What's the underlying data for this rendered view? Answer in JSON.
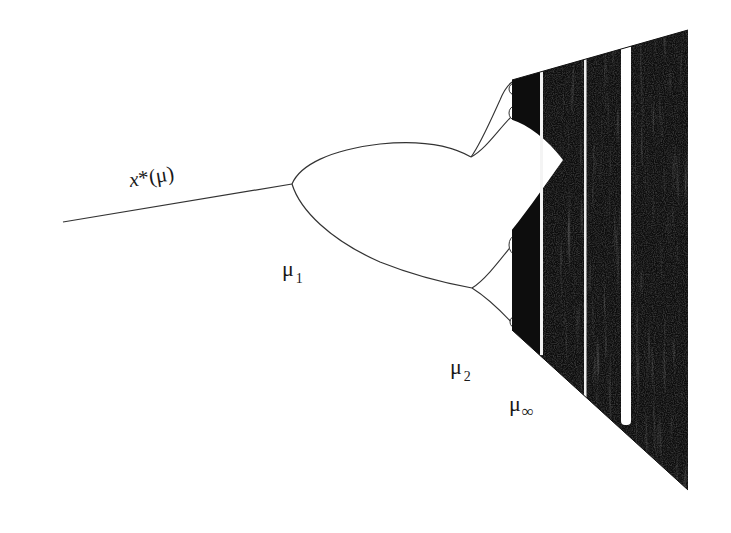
{
  "figure": {
    "background": "#ffffff",
    "ink_color": "#1a1a1a",
    "labels": {
      "fixed_point_base": "x",
      "fixed_point_suffix": "*(μ)",
      "mu1_symbol": "μ",
      "mu1_sub": "1",
      "mu2_symbol": "μ",
      "mu2_sub": "2",
      "muinf_symbol": "μ",
      "muinf_sub": "∞"
    },
    "branches": {
      "fixed_point": {
        "from": [
          63,
          222
        ],
        "to": [
          292,
          184
        ]
      },
      "period2_upper": {
        "from": [
          292,
          184
        ],
        "to": [
          471,
          157
        ]
      },
      "period2_lower": {
        "from": [
          292,
          184
        ],
        "to": [
          472,
          288
        ]
      },
      "period4": [
        {
          "from": [
            471,
            157
          ],
          "to": [
            510,
            84
          ]
        },
        {
          "from": [
            471,
            157
          ],
          "to": [
            511,
            113
          ]
        },
        {
          "from": [
            472,
            288
          ],
          "to": [
            512,
            243
          ]
        },
        {
          "from": [
            472,
            288
          ],
          "to": [
            513,
            323
          ]
        }
      ]
    },
    "chaotic_region": {
      "top_boundary": [
        [
          512,
          80
        ],
        [
          688,
          30
        ]
      ],
      "bottom_boundary": [
        [
          512,
          330
        ],
        [
          688,
          490
        ]
      ],
      "right_edge_x": 688,
      "periodic_windows_x": [
        541,
        585,
        626
      ]
    }
  }
}
